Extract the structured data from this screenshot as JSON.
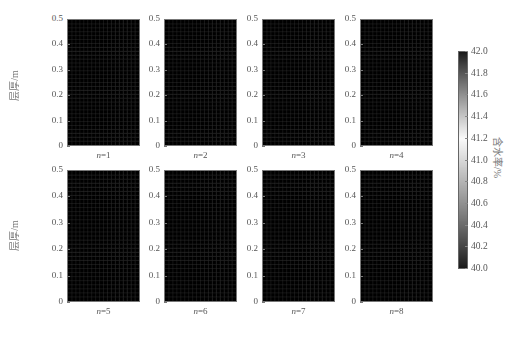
{
  "chart_data": {
    "type": "heatmap",
    "title": "",
    "ylabel": "层厚/m",
    "colorbar_label": "含水率/%",
    "colorbar": {
      "min": 40.0,
      "max": 42.0,
      "ticks": [
        "42.0",
        "41.8",
        "41.6",
        "41.4",
        "41.2",
        "41.0",
        "40.8",
        "40.6",
        "40.4",
        "40.2",
        "40.0"
      ],
      "colormap": "dark-light-dark gray (black at 40.0 and 42.0, white near 41.2)"
    },
    "yticks": [
      "0.5",
      "0.4",
      "0.3",
      "0.2",
      "0.1",
      "0"
    ],
    "ylim": [
      0,
      0.5
    ],
    "grid": {
      "columns": 18,
      "rows": 32
    },
    "panels": [
      {
        "label": "n=1",
        "n": 1,
        "profile": {
          "bottom": 40.0,
          "light_depth": 0.38,
          "top": 41.05
        }
      },
      {
        "label": "n=2",
        "n": 2,
        "profile": {
          "bottom": 40.0,
          "light_depth": 0.3,
          "top": 40.85
        }
      },
      {
        "label": "n=3",
        "n": 3,
        "profile": {
          "bottom": 40.0,
          "light_depth": 0.26,
          "top": 40.6
        }
      },
      {
        "label": "n=4",
        "n": 4,
        "profile": {
          "bottom": 40.0,
          "light_depth": 0.24,
          "top": 40.4
        }
      },
      {
        "label": "n=5",
        "n": 5,
        "profile": {
          "bottom": 40.0,
          "light_depth": 0.2,
          "top": 40.25
        }
      },
      {
        "label": "n=6",
        "n": 6,
        "profile": {
          "bottom": 40.0,
          "light_depth": 0.19,
          "top": 40.2
        }
      },
      {
        "label": "n=7",
        "n": 7,
        "profile": {
          "bottom": 40.0,
          "light_depth": 0.19,
          "top": 40.15
        }
      },
      {
        "label": "n=8",
        "n": 8,
        "profile": {
          "bottom": 40.0,
          "light_depth": 0.18,
          "top": 40.1
        }
      }
    ]
  },
  "labels": {
    "ylabel_top": "层厚/m",
    "ylabel_bottom": "层厚/m",
    "colorbar": "含水率/%",
    "n_symbol": "n",
    "panels": [
      "=1",
      "=2",
      "=3",
      "=4",
      "=5",
      "=6",
      "=7",
      "=8"
    ]
  }
}
